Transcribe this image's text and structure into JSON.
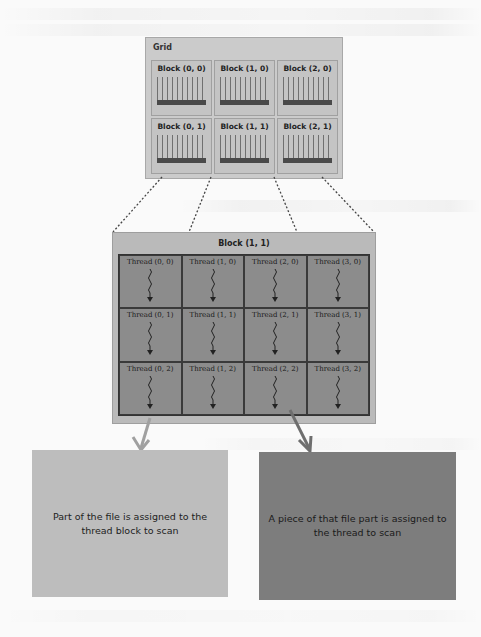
{
  "diagram": {
    "grid": {
      "title": "Grid",
      "blocks": [
        {
          "label": "Block (0, 0)"
        },
        {
          "label": "Block (1, 0)"
        },
        {
          "label": "Block (2, 0)"
        },
        {
          "label": "Block (0, 1)"
        },
        {
          "label": "Block (1, 1)"
        },
        {
          "label": "Block (2, 1)"
        }
      ]
    },
    "block_detail": {
      "title": "Block (1, 1)",
      "threads": [
        {
          "label": "Thread (0, 0)"
        },
        {
          "label": "Thread (1, 0)"
        },
        {
          "label": "Thread (2, 0)"
        },
        {
          "label": "Thread (3, 0)"
        },
        {
          "label": "Thread (0, 1)"
        },
        {
          "label": "Thread (1, 1)"
        },
        {
          "label": "Thread (2, 1)"
        },
        {
          "label": "Thread (3, 1)"
        },
        {
          "label": "Thread (0, 2)"
        },
        {
          "label": "Thread (1, 2)"
        },
        {
          "label": "Thread (2, 2)"
        },
        {
          "label": "Thread (3, 2)"
        }
      ]
    },
    "notes": {
      "block_note": "Part of the file is assigned to the thread block to scan",
      "thread_note": "A piece of that file part is assigned to the thread to scan"
    },
    "colors": {
      "grid_fill": "#cbcbcb",
      "block_fill": "#bababa",
      "thread_fill": "#8c8c8c",
      "block_note_fill": "#bdbdbd",
      "thread_note_fill": "#7d7d7d"
    }
  }
}
